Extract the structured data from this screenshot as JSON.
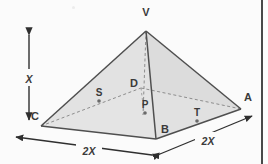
{
  "figure": {
    "colors": {
      "face_light": "#e4e4e4",
      "face_mid": "#dcdcdc",
      "face_dark": "#d2d2d2",
      "outline": "#4f4f4f",
      "hidden_line": "#8d8d8d",
      "label": "#3a3a3a",
      "background": "#fbfbfb",
      "border": "#4a4a4a"
    },
    "vertices": {
      "V": {
        "label": "V",
        "x": 146,
        "y": 31,
        "label_x": 146,
        "label_y": 16
      },
      "A": {
        "label": "A",
        "x": 241,
        "y": 109,
        "label_x": 245,
        "label_y": 101
      },
      "B": {
        "label": "B",
        "x": 156,
        "y": 139,
        "label_x": 163,
        "label_y": 131
      },
      "C": {
        "label": "C",
        "x": 41,
        "y": 126,
        "label_x": 35,
        "label_y": 117
      },
      "D": {
        "label": "D",
        "x": 141,
        "y": 88,
        "label_x": 134,
        "label_y": 84
      }
    },
    "points": [
      {
        "label": "S",
        "x": 99,
        "y": 101,
        "label_x": 97,
        "label_y": 95,
        "dot": true
      },
      {
        "label": "P",
        "x": 145,
        "y": 113,
        "label_x": 143,
        "label_y": 105,
        "dot": true
      },
      {
        "label": "T",
        "x": 197,
        "y": 121,
        "label_x": 196,
        "label_y": 113,
        "dot": true
      }
    ],
    "dimensions": [
      {
        "name": "height",
        "label": "X",
        "label_x": 27,
        "label_y": 78,
        "orientation": "vertical"
      },
      {
        "name": "base-left",
        "label": "2X",
        "label_x": 88,
        "label_y": 152,
        "orientation": "diagonal-left"
      },
      {
        "name": "base-right",
        "label": "2X",
        "label_x": 207,
        "label_y": 142,
        "orientation": "diagonal-right"
      }
    ],
    "edges": {
      "visible": [
        "V-C",
        "V-A",
        "V-B",
        "C-B",
        "B-A"
      ],
      "hidden": [
        "C-D",
        "D-A",
        "V-P",
        "D-P"
      ]
    }
  }
}
